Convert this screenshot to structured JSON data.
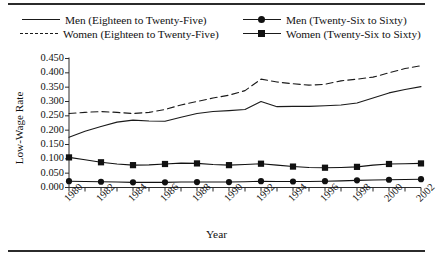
{
  "figure": {
    "ylabel": "Low-Wage Rate",
    "xlabel": "Year"
  },
  "legend": {
    "men_young": "Men (Eighteen to Twenty-Five)",
    "women_young": "Women (Eighteen to Twenty-Five)",
    "men_old": "Men (Twenty-Six to Sixty)",
    "women_old": "Women (Twenty-Six to Sixty)"
  },
  "axes": {
    "y_ticks": [
      "0.000",
      "0.050",
      "0.100",
      "0.150",
      "0.200",
      "0.250",
      "0.300",
      "0.350",
      "0.400",
      "0.450"
    ],
    "x_ticks": [
      "1980",
      "1982",
      "1984",
      "1986",
      "1988",
      "1990",
      "1992",
      "1994",
      "1996",
      "1998",
      "2000",
      "2002"
    ]
  },
  "chart_data": {
    "type": "line",
    "title": "",
    "xlabel": "Year",
    "ylabel": "Low-Wage Rate",
    "xlim": [
      1980,
      2002
    ],
    "ylim": [
      0.0,
      0.45
    ],
    "ytick_step": 0.05,
    "grid": false,
    "legend_position": "above-plot",
    "x": [
      1980,
      1981,
      1982,
      1983,
      1984,
      1985,
      1986,
      1987,
      1988,
      1989,
      1990,
      1991,
      1992,
      1993,
      1994,
      1995,
      1996,
      1997,
      1998,
      1999,
      2000,
      2001,
      2002
    ],
    "series": [
      {
        "name": "Men (Eighteen to Twenty-Five)",
        "style": "solid",
        "marker": "none",
        "color": "#1a1a1a",
        "values": [
          0.175,
          0.196,
          0.213,
          0.228,
          0.235,
          0.232,
          0.231,
          0.245,
          0.258,
          0.265,
          0.268,
          0.272,
          0.3,
          0.282,
          0.283,
          0.283,
          0.285,
          0.288,
          0.295,
          0.312,
          0.33,
          0.342,
          0.352
        ]
      },
      {
        "name": "Women (Eighteen to Twenty-Five)",
        "style": "dashed",
        "marker": "none",
        "color": "#1a1a1a",
        "values": [
          0.258,
          0.262,
          0.265,
          0.262,
          0.258,
          0.262,
          0.272,
          0.288,
          0.3,
          0.312,
          0.322,
          0.338,
          0.378,
          0.368,
          0.362,
          0.357,
          0.36,
          0.372,
          0.378,
          0.385,
          0.4,
          0.415,
          0.425
        ]
      },
      {
        "name": "Men (Twenty-Six to Sixty)",
        "style": "solid",
        "marker": "circle",
        "color": "#111111",
        "values": [
          0.022,
          0.021,
          0.02,
          0.019,
          0.018,
          0.018,
          0.018,
          0.019,
          0.019,
          0.019,
          0.019,
          0.02,
          0.022,
          0.021,
          0.021,
          0.021,
          0.022,
          0.023,
          0.025,
          0.026,
          0.027,
          0.028,
          0.029
        ]
      },
      {
        "name": "Women (Twenty-Six to Sixty)",
        "style": "solid",
        "marker": "square",
        "color": "#111111",
        "values": [
          0.105,
          0.097,
          0.088,
          0.082,
          0.078,
          0.079,
          0.082,
          0.085,
          0.084,
          0.08,
          0.078,
          0.08,
          0.083,
          0.078,
          0.073,
          0.07,
          0.069,
          0.07,
          0.072,
          0.078,
          0.082,
          0.083,
          0.084
        ]
      }
    ]
  }
}
